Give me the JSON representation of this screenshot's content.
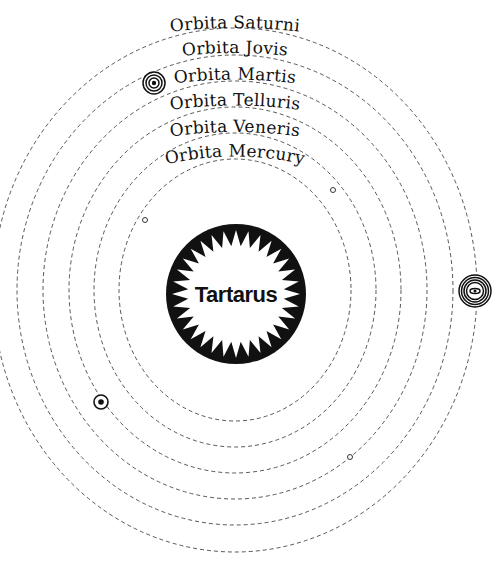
{
  "diagram": {
    "center": {
      "x": 235,
      "y": 290
    },
    "core": {
      "label": "Tartarus",
      "cx": 236,
      "cy": 294,
      "r": 70,
      "inner_r": 52,
      "spikes": 32
    },
    "orbits": [
      {
        "id": "mercury",
        "label": "Orbita Mercury",
        "rx": 116,
        "ry": 131,
        "bodies": [
          {
            "symbol": "small-ring",
            "x": 145,
            "y": 220
          },
          {
            "symbol": "small-ring",
            "x": 333,
            "y": 190
          }
        ]
      },
      {
        "id": "venus",
        "label": "Orbita Veneris",
        "rx": 141,
        "ry": 157,
        "bodies": [
          {
            "symbol": "small-ring",
            "x": 350,
            "y": 457
          }
        ]
      },
      {
        "id": "earth",
        "label": "Orbita Telluris",
        "rx": 166,
        "ry": 183,
        "bodies": [
          {
            "symbol": "dot-in-circle",
            "x": 101,
            "y": 402
          }
        ]
      },
      {
        "id": "mars",
        "label": "Orbita Martis",
        "rx": 192,
        "ry": 209,
        "bodies": []
      },
      {
        "id": "jupiter",
        "label": "Orbita Jovis",
        "rx": 218,
        "ry": 235,
        "bodies": [
          {
            "symbol": "concentric-rings",
            "x": 154,
            "y": 83
          }
        ]
      },
      {
        "id": "saturn",
        "label": "Orbita Saturni",
        "rx": 242,
        "ry": 262,
        "bodies": [
          {
            "symbol": "ringed-concentric",
            "x": 475,
            "y": 291
          }
        ]
      }
    ],
    "colors": {
      "line": "#444444",
      "text": "#111111",
      "core": "#111111",
      "background": "#ffffff"
    }
  }
}
